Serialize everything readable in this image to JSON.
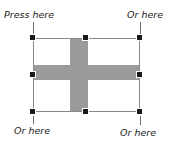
{
  "canvas": {
    "width": 170,
    "height": 144,
    "background_color": "#ffffff"
  },
  "selected_object": {
    "type": "image",
    "description": "picture with gray cross on white field",
    "fill_color": "#ffffff",
    "cross_color": "#9b9b9b",
    "border_color": "#8a8a8a",
    "bounds": {
      "left": 33,
      "top": 38,
      "width": 107,
      "height": 74
    }
  },
  "selection_handles": {
    "color": "#1a1a1a",
    "size": 7,
    "items": [
      {
        "id": "top-left",
        "name": "handle-top-left",
        "x": 33,
        "y": 38
      },
      {
        "id": "top-middle",
        "name": "handle-top-middle",
        "x": 86,
        "y": 38
      },
      {
        "id": "top-right",
        "name": "handle-top-right",
        "x": 140,
        "y": 38
      },
      {
        "id": "middle-left",
        "name": "handle-middle-left",
        "x": 33,
        "y": 75
      },
      {
        "id": "middle-right",
        "name": "handle-middle-right",
        "x": 140,
        "y": 75
      },
      {
        "id": "bottom-left",
        "name": "handle-bottom-left",
        "x": 33,
        "y": 112
      },
      {
        "id": "bottom-middle",
        "name": "handle-bottom-middle",
        "x": 86,
        "y": 112
      },
      {
        "id": "bottom-right",
        "name": "handle-bottom-right",
        "x": 140,
        "y": 112
      }
    ]
  },
  "callouts": {
    "top_left": "Press here",
    "top_right": "Or here",
    "bottom_left": "Or here",
    "bottom_right": "Or here"
  }
}
